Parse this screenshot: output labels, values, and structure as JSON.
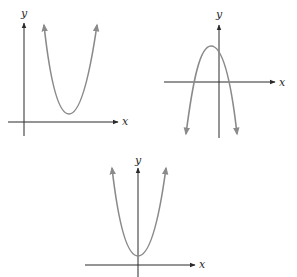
{
  "figure": {
    "graphs": [
      {
        "id": "graph-1",
        "shape": "parabola opening upward, vertex above x-axis, right of y-axis",
        "x_label": "x",
        "y_label": "y",
        "axes": {
          "origin": [
            24,
            122
          ],
          "x_start": 8,
          "x_end": 118,
          "y_top": 22,
          "y_bottom": 136
        },
        "curve": {
          "left_top": [
            44,
            24
          ],
          "vertex": [
            69,
            114
          ],
          "right_top": [
            97,
            24
          ]
        },
        "curve_color": "#8a8a8a"
      },
      {
        "id": "graph-2",
        "shape": "parabola opening downward, vertex above x-axis, left of y-axis",
        "x_label": "x",
        "y_label": "y",
        "axes": {
          "origin": [
            219,
            82
          ],
          "x_start": 164,
          "x_end": 275,
          "y_top": 24,
          "y_bottom": 138
        },
        "curve": {
          "left_bottom": [
            186,
            135
          ],
          "vertex": [
            211,
            46
          ],
          "right_bottom": [
            237,
            135
          ]
        },
        "curve_color": "#8a8a8a"
      },
      {
        "id": "graph-3",
        "shape": "parabola opening upward, vertex on y-axis above x-axis",
        "x_label": "x",
        "y_label": "y",
        "axes": {
          "origin": [
            138,
            265
          ],
          "x_start": 85,
          "x_end": 195,
          "y_top": 167,
          "y_bottom": 277
        },
        "curve": {
          "left_top": [
            112,
            167
          ],
          "vertex": [
            138,
            256
          ],
          "right_top": [
            166,
            167
          ]
        },
        "curve_color": "#8a8a8a"
      }
    ]
  }
}
